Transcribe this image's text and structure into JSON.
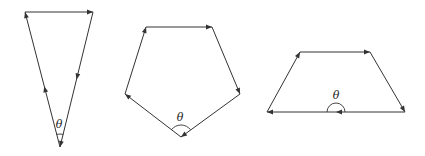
{
  "figures": [
    {
      "name": "triangle",
      "vertices": [
        [
          25,
          12
        ],
        [
          93,
          12
        ],
        [
          60,
          147
        ]
      ],
      "angle_label": "θ",
      "label_pos": [
        59,
        128
      ],
      "arc": {
        "cx": 60,
        "cy": 147,
        "r": 13,
        "from_deg": -105,
        "to_deg": -75
      },
      "arrows": [
        {
          "from": [
            25,
            12
          ],
          "to": [
            93,
            12
          ],
          "t": 1.0
        },
        {
          "from": [
            93,
            12
          ],
          "to": [
            60,
            147
          ],
          "t": 0.5
        },
        {
          "from": [
            93,
            12
          ],
          "to": [
            60,
            147
          ],
          "t": 1.0
        },
        {
          "from": [
            60,
            147
          ],
          "to": [
            25,
            12
          ],
          "t": 0.45
        },
        {
          "from": [
            60,
            147
          ],
          "to": [
            25,
            12
          ],
          "t": 1.0
        }
      ]
    },
    {
      "name": "pentagon",
      "vertices": [
        [
          146,
          27
        ],
        [
          212,
          27
        ],
        [
          240,
          94
        ],
        [
          181,
          137
        ],
        [
          125,
          94
        ]
      ],
      "angle_label": "θ",
      "label_pos": [
        180,
        121
      ],
      "arc": {
        "cx": 181,
        "cy": 137,
        "r": 12,
        "from_deg": -143,
        "to_deg": -37
      },
      "arrows": [
        {
          "from": [
            146,
            27
          ],
          "to": [
            212,
            27
          ],
          "t": 1.0
        },
        {
          "from": [
            212,
            27
          ],
          "to": [
            240,
            94
          ],
          "t": 1.0
        },
        {
          "from": [
            240,
            94
          ],
          "to": [
            181,
            137
          ],
          "t": 1.0
        },
        {
          "from": [
            181,
            137
          ],
          "to": [
            125,
            94
          ],
          "t": 1.0
        },
        {
          "from": [
            125,
            94
          ],
          "to": [
            146,
            27
          ],
          "t": 1.0
        }
      ]
    },
    {
      "name": "trapezoid",
      "vertices": [
        [
          300,
          52
        ],
        [
          370,
          52
        ],
        [
          405,
          112
        ],
        [
          267,
          112
        ]
      ],
      "angle_label": "θ",
      "label_pos": [
        336,
        99
      ],
      "arc": {
        "cx": 336,
        "cy": 112,
        "r": 9,
        "from_deg": 180,
        "to_deg": 360
      },
      "arrows": [
        {
          "from": [
            300,
            52
          ],
          "to": [
            370,
            52
          ],
          "t": 1.0
        },
        {
          "from": [
            370,
            52
          ],
          "to": [
            405,
            112
          ],
          "t": 1.0
        },
        {
          "from": [
            405,
            112
          ],
          "to": [
            267,
            112
          ],
          "t": 0.5
        },
        {
          "from": [
            405,
            112
          ],
          "to": [
            267,
            112
          ],
          "t": 1.0
        },
        {
          "from": [
            267,
            112
          ],
          "to": [
            300,
            52
          ],
          "t": 1.0
        }
      ]
    }
  ],
  "colors": {
    "stroke": "#333333",
    "label": "#222222"
  }
}
